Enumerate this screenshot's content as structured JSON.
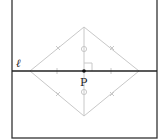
{
  "diagram": {
    "line_label": "ℓ",
    "point_label": "P",
    "colors": {
      "frame": "#333333",
      "line": "#222222",
      "construction": "#c8c8c8",
      "point": "#111111"
    }
  }
}
